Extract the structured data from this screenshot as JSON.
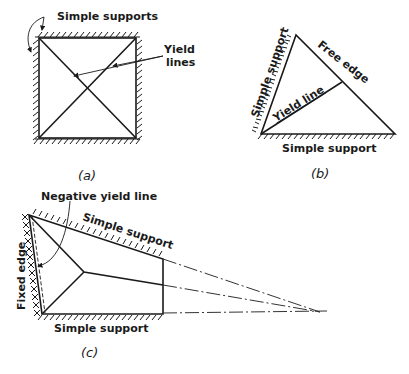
{
  "figure_a": {
    "caption": "(a)",
    "labels": {
      "supports": "Simple supports",
      "yield_lines_1": "Yield",
      "yield_lines_2": "lines"
    }
  },
  "figure_b": {
    "caption": "(b)",
    "labels": {
      "left_support": "Simple support",
      "free_edge": "Free edge",
      "yield_line": "Yield line",
      "bottom_support": "Simple support"
    }
  },
  "figure_c": {
    "caption": "(c)",
    "labels": {
      "negative_yield_line": "Negative yield line",
      "top_support": "Simple support",
      "fixed_edge": "Fixed edge",
      "bottom_support": "Simple support"
    }
  }
}
